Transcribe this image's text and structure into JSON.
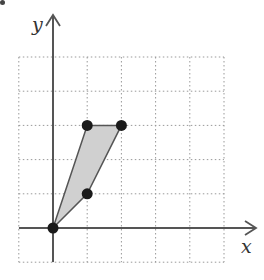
{
  "diagram": {
    "type": "coordinate-plane",
    "axes": {
      "x_label": "x",
      "y_label": "y"
    },
    "grid": {
      "style": "dotted",
      "x_min": -1,
      "x_max": 5,
      "y_min": -1,
      "y_max": 5,
      "step": 1
    },
    "shape": {
      "type": "quadrilateral",
      "fill": "#d0d0d0",
      "stroke": "#555555",
      "vertices": [
        {
          "x": 0,
          "y": 0
        },
        {
          "x": 1,
          "y": 1
        },
        {
          "x": 2,
          "y": 3
        },
        {
          "x": 1,
          "y": 3
        }
      ]
    },
    "points": [
      {
        "x": 0,
        "y": 0
      },
      {
        "x": 1,
        "y": 1
      },
      {
        "x": 1,
        "y": 3
      },
      {
        "x": 2,
        "y": 3
      }
    ],
    "colors": {
      "axis": "#555555",
      "grid": "#999999",
      "point": "#1a1a1a"
    }
  }
}
